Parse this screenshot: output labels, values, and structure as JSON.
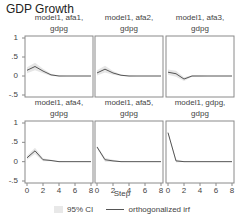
{
  "chart_data": {
    "type": "line",
    "title": "GDP Growth",
    "xlabel": "Step",
    "ylabel": "",
    "xlim": [
      0,
      8
    ],
    "ylim": [
      -0.5,
      1
    ],
    "x_ticks": [
      "0",
      "2",
      "4",
      "6",
      "8"
    ],
    "y_ticks": [
      "-.5",
      "0",
      ".5",
      "1"
    ],
    "x": [
      0,
      1,
      2,
      3,
      4,
      5,
      6,
      7,
      8
    ],
    "legend": [
      "95% CI",
      "orthogonalized irf"
    ],
    "legend_position": "bottom",
    "grid": false,
    "panels": [
      {
        "title_line1": "model1, afa1,",
        "title_line2": "gdpg",
        "irf": [
          0.15,
          0.25,
          0.13,
          0.03,
          0.0,
          0.0,
          0.0,
          0.0,
          0.0
        ],
        "ci_half": [
          0.08,
          0.1,
          0.06,
          0.03,
          0.01,
          0.0,
          0.0,
          0.0,
          0.0
        ]
      },
      {
        "title_line1": "model1, afa2,",
        "title_line2": "gdpg",
        "irf": [
          0.08,
          0.18,
          0.08,
          0.02,
          0.0,
          0.0,
          0.0,
          0.0,
          0.0
        ],
        "ci_half": [
          0.07,
          0.09,
          0.05,
          0.02,
          0.01,
          0.0,
          0.0,
          0.0,
          0.0
        ]
      },
      {
        "title_line1": "model1, afa3,",
        "title_line2": "gdpg",
        "irf": [
          0.1,
          0.06,
          -0.08,
          0.0,
          0.0,
          0.0,
          0.0,
          0.0,
          0.0
        ],
        "ci_half": [
          0.07,
          0.08,
          0.05,
          0.02,
          0.01,
          0.0,
          0.0,
          0.0,
          0.0
        ]
      },
      {
        "title_line1": "model1, afa4,",
        "title_line2": "gdpg",
        "irf": [
          0.1,
          0.28,
          0.05,
          0.03,
          0.0,
          0.0,
          0.0,
          0.0,
          0.0
        ],
        "ci_half": [
          0.05,
          0.08,
          0.04,
          0.02,
          0.01,
          0.0,
          0.0,
          0.0,
          0.0
        ]
      },
      {
        "title_line1": "model1, afa5,",
        "title_line2": "gdpg",
        "irf": [
          0.38,
          0.05,
          0.02,
          0.0,
          0.0,
          0.0,
          0.0,
          0.0,
          0.0
        ],
        "ci_half": [
          0.03,
          0.05,
          0.03,
          0.01,
          0.0,
          0.0,
          0.0,
          0.0,
          0.0
        ]
      },
      {
        "title_line1": "model1, gdpg,",
        "title_line2": "gdpg",
        "irf": [
          0.75,
          0.02,
          0.0,
          0.0,
          0.0,
          0.0,
          0.0,
          0.0,
          0.0
        ],
        "ci_half": [
          0.02,
          0.04,
          0.01,
          0.0,
          0.0,
          0.0,
          0.0,
          0.0,
          0.0
        ]
      }
    ]
  },
  "colors": {
    "line": "#555555",
    "ci": "#e6e6e6",
    "frame": "#8a8a8a"
  }
}
